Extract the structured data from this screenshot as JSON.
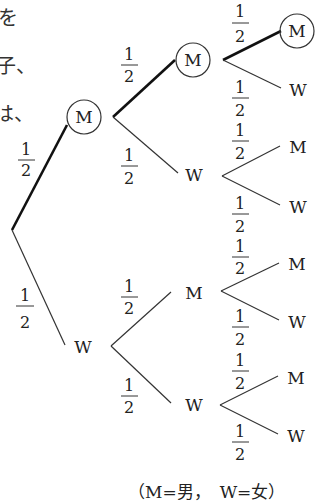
{
  "left_fragments": [
    "を",
    "子、",
    "は、"
  ],
  "nodes": {
    "root_M": "M",
    "root_W": "W",
    "l2_MM": "M",
    "l2_MW": "W",
    "l2_WM": "M",
    "l2_WW": "W",
    "l3_MMM": "M",
    "l3_MMW": "W",
    "l3_MWM": "M",
    "l3_MWW": "W",
    "l3_WMM": "M",
    "l3_WMW": "W",
    "l3_WWM": "M",
    "l3_WWW": "W"
  },
  "probability": {
    "numerator": "1",
    "denominator": "2"
  },
  "highlighted_path": [
    "M",
    "M",
    "M"
  ],
  "caption": "（M=男，　W=女）"
}
